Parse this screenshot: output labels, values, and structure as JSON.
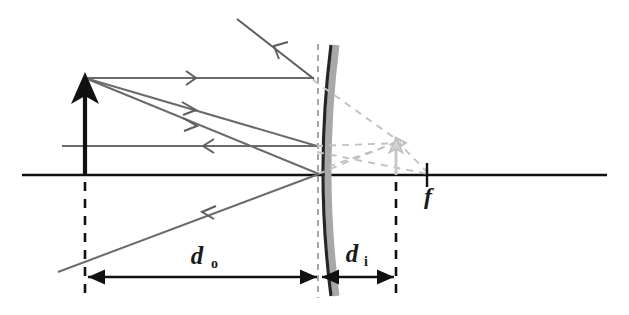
{
  "figure": {
    "kind": "ray-diagram",
    "background_color": "#ffffff"
  },
  "colors": {
    "axis": "#111111",
    "object_arrow": "#111111",
    "incident_ray": "#6b6b6b",
    "reflected_ray": "#5e5e5e",
    "mirror_line": "#262626",
    "mirror_shadow": "#a8a8a8",
    "virtual_ray_dashed": "#c2c2c2",
    "image_arrow": "#c9c9c9",
    "dimension_line": "#111111",
    "dashed_vertical": "#111111",
    "mirror_dashed_vertical": "#8a8a8a",
    "label_text": "#1a1a1a"
  },
  "labels": {
    "object_distance": {
      "symbol": "d",
      "subscript": "o",
      "text": "do",
      "x": 205,
      "y": 265
    },
    "image_distance": {
      "symbol": "d",
      "subscript": "i",
      "text": "di",
      "x": 357,
      "y": 262
    },
    "focal_point": {
      "symbol": "f",
      "text": "f",
      "x": 432,
      "y": 198
    }
  },
  "elements": {
    "principal_axis": {
      "name": "principal-axis",
      "x1": 22,
      "y1": 175,
      "x2": 607,
      "y2": 175
    },
    "object": {
      "name": "object-arrow",
      "base_x": 85,
      "base_y": 175,
      "tip_x": 85,
      "tip_y": 78,
      "description": "upright solid black arrow (object)"
    },
    "image": {
      "name": "virtual-image-arrow",
      "base_x": 396,
      "base_y": 175,
      "tip_x": 396,
      "tip_y": 143,
      "description": "small light gray outlined upright arrow (virtual image)"
    },
    "mirror": {
      "name": "convex-mirror",
      "vertex_x": 320,
      "vertex_y": 175,
      "top_x": 332,
      "top_y": 45,
      "bottom_x": 332,
      "bottom_y": 296,
      "description": "convex mirror, reflective surface facing left"
    },
    "focal_tick": {
      "name": "focal-point-tick",
      "x": 427,
      "y": 175
    },
    "dashed_verticals": [
      {
        "name": "object-plane-dashed-line",
        "x": 85,
        "y1": 182,
        "y2": 296
      },
      {
        "name": "mirror-plane-dashed-line",
        "x": 318,
        "y1": 44,
        "y2": 298
      },
      {
        "name": "image-plane-dashed-line",
        "x": 396,
        "y1": 182,
        "y2": 298
      }
    ],
    "dimension_arrows": [
      {
        "name": "object-distance-dimension",
        "x1": 87,
        "x2": 318,
        "y": 277,
        "double_headed": true
      },
      {
        "name": "image-distance-dimension",
        "x1": 322,
        "x2": 394,
        "y": 277,
        "double_headed": false
      }
    ],
    "incident_rays": [
      {
        "name": "incident-ray-parallel",
        "from_x": 85,
        "from_y": 78,
        "to_x": 313,
        "to_y": 78
      },
      {
        "name": "incident-ray-to-focus",
        "from_x": 85,
        "from_y": 78,
        "to_x": 316,
        "to_y": 145
      },
      {
        "name": "incident-ray-to-vertex",
        "from_x": 85,
        "from_y": 78,
        "to_x": 318,
        "to_y": 174
      }
    ],
    "reflected_rays": [
      {
        "name": "reflected-ray-upper-left",
        "from_x": 313,
        "from_y": 78,
        "to_x": 235,
        "to_y": 18
      },
      {
        "name": "reflected-ray-horizontal",
        "from_x": 316,
        "from_y": 145,
        "to_x": 62,
        "to_y": 145
      },
      {
        "name": "reflected-ray-lower-left",
        "from_x": 318,
        "from_y": 174,
        "to_x": 60,
        "to_y": 270
      }
    ],
    "virtual_dashed_rays": [
      {
        "name": "virtual-ray-from-top",
        "from_x": 313,
        "from_y": 78,
        "to_x": 398,
        "to_y": 142
      },
      {
        "name": "virtual-ray-horizontal-extension",
        "from_x": 316,
        "from_y": 145,
        "to_x": 400,
        "to_y": 143
      },
      {
        "name": "virtual-ray-from-vertex",
        "from_x": 318,
        "from_y": 174,
        "to_x": 400,
        "to_y": 141
      },
      {
        "name": "virtual-ray-to-focal-point",
        "from_x": 318,
        "from_y": 152,
        "to_x": 427,
        "to_y": 175
      },
      {
        "name": "virtual-ray-focal-to-image",
        "from_x": 427,
        "from_y": 174,
        "to_x": 393,
        "to_y": 138
      }
    ]
  }
}
